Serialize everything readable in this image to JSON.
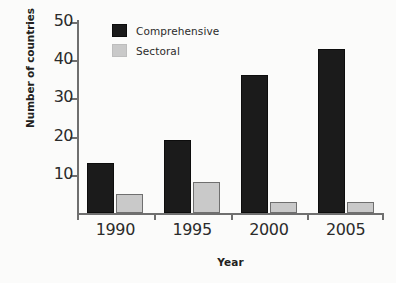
{
  "chart_data": {
    "type": "bar",
    "title": "",
    "subtitle": "",
    "xlabel": "Year",
    "ylabel": "Number of countries",
    "categories": [
      "1990",
      "1995",
      "2000",
      "2005"
    ],
    "series": [
      {
        "name": "Comprehensive",
        "values": [
          13,
          19,
          36,
          43
        ],
        "color": "#1b1b1b"
      },
      {
        "name": "Sectoral",
        "values": [
          5,
          8,
          3,
          3
        ],
        "color": "#c9c9c9"
      }
    ],
    "ylim": [
      0,
      50
    ],
    "yticks": [
      10,
      20,
      30,
      40,
      50
    ],
    "ytick_labels": [
      "10",
      "20",
      "30",
      "40",
      "50"
    ],
    "grid": false,
    "legend_position": "top-left-inside",
    "legend": [
      "Comprehensive",
      "Sectoral"
    ],
    "annotations": []
  },
  "axes": {
    "y_title": "Number of countries",
    "x_title": "Year",
    "y_tick_labels": [
      "50",
      "40",
      "30",
      "20",
      "10"
    ],
    "x_tick_labels": [
      "1990",
      "1995",
      "2000",
      "2005"
    ]
  },
  "legend": {
    "items": [
      {
        "label": "Comprehensive",
        "swatch": "comprehensive-swatch"
      },
      {
        "label": "Sectoral",
        "swatch": "sectoral-swatch"
      }
    ]
  },
  "colors": {
    "comprehensive": "#1b1b1b",
    "sectoral": "#c9c9c9",
    "axis": "#6f6f6f",
    "text": "#2b2b2b",
    "background": "#fbfbfa"
  }
}
